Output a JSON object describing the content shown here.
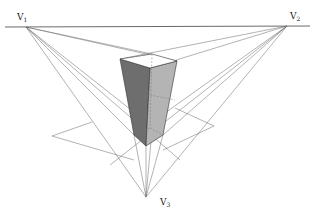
{
  "diagram": {
    "colors": {
      "line": "#555555",
      "horizon": "#444444",
      "left_face": "#6e6e6e",
      "right_face": "#b4b4b4",
      "top_face": "#ffffff",
      "hidden": "#888888"
    },
    "vanishing_points": [
      {
        "id": "V1",
        "label": "V",
        "sub": "1",
        "x": 26,
        "y": 27,
        "lx": 17,
        "ly": 20
      },
      {
        "id": "V2",
        "label": "V",
        "sub": "2",
        "x": 287,
        "y": 26,
        "lx": 290,
        "ly": 19
      },
      {
        "id": "V3",
        "label": "V",
        "sub": "3",
        "x": 146,
        "y": 197,
        "lx": 160,
        "ly": 205
      }
    ],
    "horizon": {
      "x1": 5,
      "y1": 27,
      "x2": 310,
      "y2": 26
    }
  }
}
